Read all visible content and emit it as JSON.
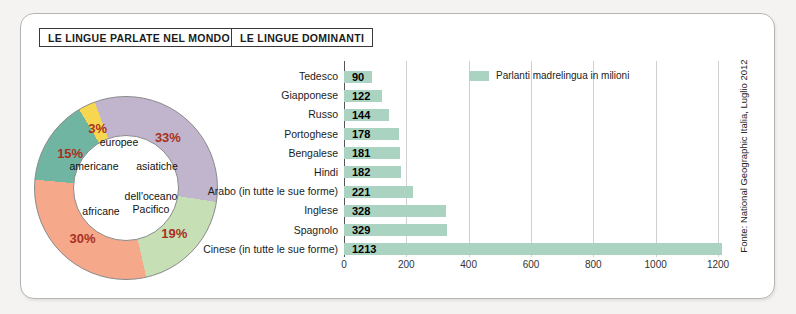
{
  "titles": {
    "left": "LE LINGUE PARLATE NEL MONDO",
    "right": "LE LINGUE DOMINANTI"
  },
  "source": "Fonte: National Geographic Italia, Luglio 2012",
  "chart_data": [
    {
      "type": "pie",
      "title": "LE LINGUE PARLATE NEL MONDO",
      "donut": true,
      "unit": "percent",
      "start_angle_deg": -20,
      "pct_label_color": "#a93122",
      "segments": [
        {
          "label": "asiatiche",
          "value": 33,
          "pct_label": "33%",
          "color": "#c1b5ce"
        },
        {
          "label": "dell'oceano Pacifico",
          "value": 19,
          "pct_label": "19%",
          "color": "#c6dfb5"
        },
        {
          "label": "africane",
          "value": 30,
          "pct_label": "30%",
          "color": "#f5a88a"
        },
        {
          "label": "americane",
          "value": 15,
          "pct_label": "15%",
          "color": "#70b5a2"
        },
        {
          "label": "europee",
          "value": 3,
          "pct_label": "3%",
          "color": "#f7d74f"
        }
      ]
    },
    {
      "type": "bar",
      "title": "LE LINGUE DOMINANTI",
      "orientation": "horizontal",
      "legend": "Parlanti madrelingua in milioni",
      "bar_color": "#abd3c1",
      "categories": [
        "Tedesco",
        "Giapponese",
        "Russo",
        "Portoghese",
        "Bengalese",
        "Hindi",
        "Arabo (in tutte le sue forme)",
        "Inglese",
        "Spagnolo",
        "Cinese (in tutte le sue forme)"
      ],
      "values": [
        90,
        122,
        144,
        178,
        181,
        182,
        221,
        328,
        329,
        1213
      ],
      "xticks": [
        0,
        200,
        400,
        600,
        800,
        1000,
        1200
      ],
      "xlim": [
        0,
        1200
      ],
      "grid": "vertical"
    }
  ]
}
